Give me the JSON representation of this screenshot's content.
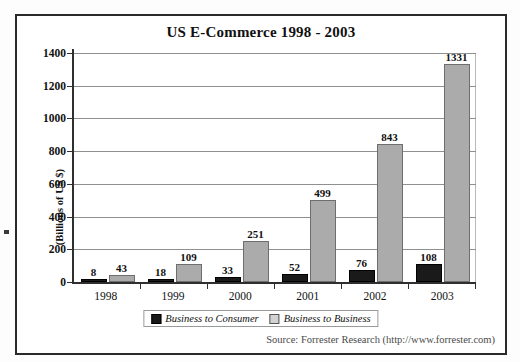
{
  "figure": {
    "title": "US E-Commerce 1998 - 2003",
    "source_text": "Source: Forrester Research (http://www.forrester.com)"
  },
  "legend": {
    "items": [
      {
        "label": "Business to Consumer",
        "color": "#1a1a1a"
      },
      {
        "label": "Business to Business",
        "color": "#d2d2d2"
      }
    ]
  },
  "axes": {
    "y_title": "(Billions of US $)",
    "y_ticks": [
      "1400",
      "1200",
      "1000",
      "800",
      "600",
      "400",
      "200",
      "0"
    ],
    "x_ticks": [
      "1998",
      "1999",
      "2000",
      "2001",
      "2002",
      "2003"
    ]
  },
  "values": {
    "b2c": [
      "8",
      "18",
      "33",
      "52",
      "76",
      "108"
    ],
    "b2b": [
      "43",
      "109",
      "251",
      "499",
      "843",
      "1331"
    ]
  },
  "chart_data": {
    "type": "bar",
    "title": "US E-Commerce 1998 - 2003",
    "xlabel": "",
    "ylabel": "(Billions of US $)",
    "categories": [
      "1998",
      "1999",
      "2000",
      "2001",
      "2002",
      "2003"
    ],
    "series": [
      {
        "name": "Business to Consumer",
        "values": [
          8,
          18,
          33,
          52,
          76,
          108
        ],
        "color": "#1a1a1a"
      },
      {
        "name": "Business to Business",
        "values": [
          43,
          109,
          251,
          499,
          843,
          1331
        ],
        "color": "#ababab"
      }
    ],
    "ylim": [
      0,
      1400
    ],
    "ytick_step": 200,
    "grid": "horizontal",
    "legend_position": "bottom",
    "data_labels": true,
    "annotations": [
      "Source: Forrester Research (http://www.forrester.com)"
    ]
  }
}
